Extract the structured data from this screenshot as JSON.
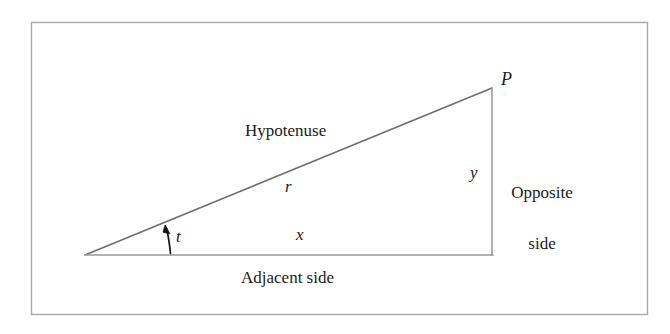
{
  "figure": {
    "kind": "right-triangle-trigonometry-diagram",
    "frame": {
      "stroke_color": "#a8a8a8",
      "x": 31,
      "y": 22,
      "width": 617,
      "height": 293
    },
    "colors": {
      "line": "#6e6e6e",
      "text": "#1b1b1b",
      "background": "#ffffff",
      "arc": "#1b1b1b"
    },
    "geometry": {
      "origin_vertex": {
        "x": 85,
        "y": 255
      },
      "right_angle_vertex": {
        "x": 492,
        "y": 255
      },
      "apex_vertex": {
        "x": 492,
        "y": 88
      },
      "angle_arc": {
        "base_point": {
          "x": 170,
          "y": 254
        },
        "tip_point": {
          "x": 165,
          "y": 226
        }
      }
    },
    "labels": {
      "point_p": "P",
      "hypotenuse": "Hypotenuse",
      "radius": "r",
      "opposite_side_line1": "Opposite",
      "opposite_side_line2": "side",
      "opposite_length": "y",
      "adjacent_length": "x",
      "adjacent_side": "Adjacent side",
      "angle": "t"
    }
  }
}
